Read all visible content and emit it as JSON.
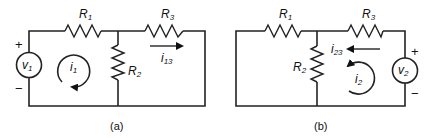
{
  "figure": {
    "panels": [
      {
        "id": "a",
        "caption": "(a)",
        "resistors": [
          {
            "name": "R",
            "sub": "1"
          },
          {
            "name": "R",
            "sub": "2"
          },
          {
            "name": "R",
            "sub": "3"
          }
        ],
        "source": {
          "name": "v",
          "sub": "1",
          "plus": "+",
          "minus": "−"
        },
        "loop_current": {
          "name": "i",
          "sub": "1",
          "direction": "clockwise"
        },
        "branch_current": {
          "name": "i",
          "sub": "13",
          "direction": "right"
        }
      },
      {
        "id": "b",
        "caption": "(b)",
        "resistors": [
          {
            "name": "R",
            "sub": "1"
          },
          {
            "name": "R",
            "sub": "2"
          },
          {
            "name": "R",
            "sub": "3"
          }
        ],
        "source": {
          "name": "v",
          "sub": "2",
          "plus": "+",
          "minus": "−"
        },
        "loop_current": {
          "name": "i",
          "sub": "2",
          "direction": "counterclockwise"
        },
        "branch_current": {
          "name": "i",
          "sub": "23",
          "direction": "left"
        }
      }
    ],
    "colors": {
      "line": "#222222",
      "background": "#ffffff"
    }
  }
}
